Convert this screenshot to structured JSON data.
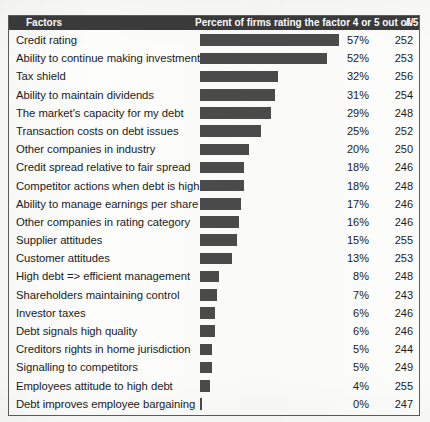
{
  "table": {
    "columns": {
      "factors": "Factors",
      "percent": "Percent of firms rating the factor 4 or 5 out of 5",
      "n": "N"
    }
  },
  "chart_data": {
    "type": "bar",
    "title": "Percent of firms rating the factor 4 or 5 out of 5",
    "xlabel": "",
    "ylabel": "Factors",
    "xlim": [
      0,
      60
    ],
    "grid": false,
    "legend": null,
    "orientation": "horizontal",
    "categories": [
      "Credit rating",
      "Ability to continue making investments",
      "Tax shield",
      "Ability to maintain dividends",
      "The market's capacity for my debt",
      "Transaction costs on debt issues",
      "Other companies in industry",
      "Credit spread relative to fair spread",
      "Competitor actions when debt is high",
      "Ability to manage earnings per share",
      "Other companies in rating category",
      "Supplier attitudes",
      "Customer attitudes",
      "High debt => efficient management",
      "Shareholders maintaining control",
      "Investor taxes",
      "Debt signals high quality",
      "Creditors rights in home jurisdiction",
      "Signalling to competitors",
      "Employees attitude to high debt",
      "Debt improves employee bargaining"
    ],
    "values": [
      57,
      52,
      32,
      31,
      29,
      25,
      20,
      18,
      18,
      17,
      16,
      15,
      13,
      8,
      7,
      6,
      6,
      5,
      5,
      4,
      0
    ],
    "value_labels": [
      "57%",
      "52%",
      "32%",
      "31%",
      "29%",
      "25%",
      "20%",
      "18%",
      "18%",
      "17%",
      "16%",
      "15%",
      "13%",
      "8%",
      "7%",
      "6%",
      "6%",
      "5%",
      "5%",
      "4%",
      "0%"
    ],
    "n_values": [
      "252",
      "253",
      "256",
      "254",
      "248",
      "252",
      "250",
      "246",
      "248",
      "246",
      "246",
      "255",
      "253",
      "248",
      "243",
      "246",
      "246",
      "244",
      "249",
      "255",
      "247"
    ],
    "bar_color": "#4b4b4b"
  },
  "caption": ""
}
